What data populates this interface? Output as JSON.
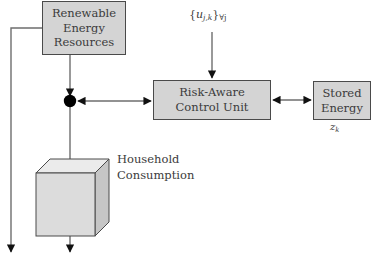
{
  "diagram": {
    "background_color": "#ffffff",
    "box_fill_color": "#d4d4d4",
    "box_border_color": "#4a4a4a",
    "connector_color": "#6e6e6e",
    "junction_color": "#000000",
    "nodes": {
      "renewable": {
        "lines": [
          "Renewable",
          "Energy",
          "Resources"
        ],
        "line1": "Renewable",
        "line2": "Energy",
        "line3": "Resources"
      },
      "control_unit": {
        "lines": [
          "Risk-Aware",
          "Control Unit"
        ],
        "line1": "Risk-Aware",
        "line2": "Control Unit"
      },
      "storage": {
        "lines": [
          "Stored",
          "Energy"
        ],
        "line1": "Stored",
        "line2": "Energy",
        "state_label": "z",
        "state_subscript": "k"
      },
      "household": {
        "lines": [
          "Household",
          "Consumption"
        ],
        "line1": "Household",
        "line2": "Consumption",
        "shape": "cube"
      }
    },
    "annotations": {
      "control_inputs": {
        "open_brace": "{",
        "variable": "u",
        "subscript": "j,k",
        "close_brace": "}",
        "quantifier": "∀j",
        "full_text": "{u_{j,k}}_{∀j}"
      }
    },
    "edges": [
      {
        "name": "renewable-to-junction",
        "from": "renewable",
        "to": "junction",
        "arrow": "single"
      },
      {
        "name": "junction-to-control",
        "from": "junction",
        "to": "control_unit",
        "arrow": "double"
      },
      {
        "name": "control-to-storage",
        "from": "control_unit",
        "to": "storage",
        "arrow": "double"
      },
      {
        "name": "inputs-to-control",
        "from": "control_inputs",
        "to": "control_unit",
        "arrow": "single"
      },
      {
        "name": "junction-to-household",
        "from": "junction",
        "to": "household",
        "arrow": "single"
      },
      {
        "name": "household-output",
        "from": "household",
        "to": "sink",
        "arrow": "single"
      },
      {
        "name": "renewable-bypass-output",
        "from": "renewable",
        "to": "sink",
        "arrow": "single"
      }
    ]
  }
}
